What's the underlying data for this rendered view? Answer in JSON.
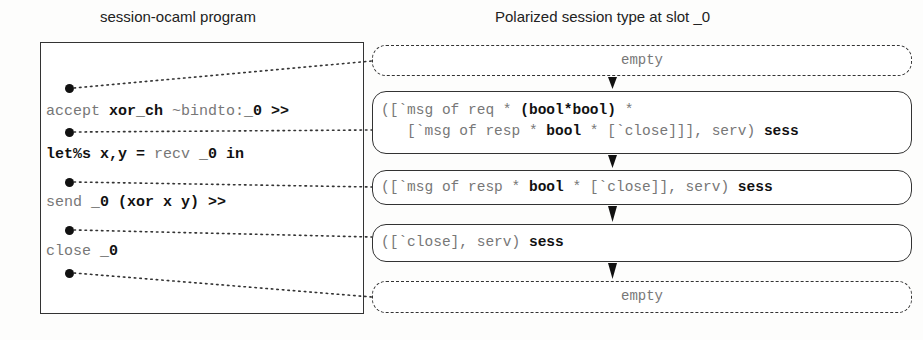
{
  "headers": {
    "left": "session-ocaml  program",
    "right": "Polarized session type at slot _0"
  },
  "program": {
    "lines": [
      {
        "parts": [
          {
            "t": "accept ",
            "bold": false
          },
          {
            "t": "xor_ch",
            "bold": true
          },
          {
            "t": " ~bindto:",
            "bold": false
          },
          {
            "t": "_0 >>",
            "bold": true
          }
        ]
      },
      {
        "parts": [
          {
            "t": "let%s x,y = ",
            "bold": true
          },
          {
            "t": "recv ",
            "bold": false
          },
          {
            "t": "_0 in",
            "bold": true
          }
        ]
      },
      {
        "parts": [
          {
            "t": "send ",
            "bold": false
          },
          {
            "t": "_0 (xor x y) >>",
            "bold": true
          }
        ]
      },
      {
        "parts": [
          {
            "t": "close ",
            "bold": false
          },
          {
            "t": "_0",
            "bold": true
          }
        ]
      }
    ],
    "line_text": [
      "accept xor_ch ~bindto:_0 >>",
      "let%s x,y = recv _0 in",
      "send _0 (xor x y) >>",
      "close _0"
    ]
  },
  "types": [
    {
      "kind": "empty",
      "text": "empty"
    },
    {
      "kind": "type",
      "lines": [
        "([`msg of req * (bool*bool) *",
        "   [`msg of resp * bool * [`close]]], serv) sess"
      ]
    },
    {
      "kind": "type",
      "lines": [
        "([`msg of resp * bool * [`close]], serv) sess"
      ]
    },
    {
      "kind": "type",
      "lines": [
        "([`close], serv) sess"
      ]
    },
    {
      "kind": "empty",
      "text": "empty"
    }
  ]
}
